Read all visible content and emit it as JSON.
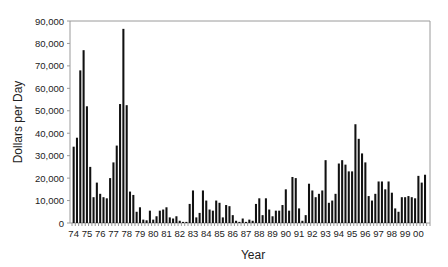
{
  "chart_data": {
    "type": "bar",
    "title": "",
    "xlabel": "Year",
    "ylabel": "Dollars per Day",
    "ylim": [
      0,
      90000
    ],
    "yticks": [
      "0",
      "10,000",
      "20,000",
      "30,000",
      "40,000",
      "50,000",
      "60,000",
      "70,000",
      "80,000",
      "90,000"
    ],
    "xtick_labels": [
      "74",
      "75",
      "76",
      "77",
      "78",
      "79",
      "80",
      "81",
      "82",
      "83",
      "84",
      "85",
      "86",
      "87",
      "88",
      "89",
      "90",
      "91",
      "92",
      "93",
      "94",
      "95",
      "96",
      "97",
      "98",
      "99",
      "00"
    ],
    "grid": false,
    "legend": null,
    "bar_color": "#111111",
    "frequency": "quarterly",
    "series": [
      {
        "name": "Dollars per Day",
        "values": [
          34000,
          38000,
          68000,
          77000,
          52000,
          25000,
          11500,
          18000,
          13000,
          11500,
          11000,
          20000,
          27000,
          34500,
          53000,
          86500,
          52500,
          14000,
          12500,
          5000,
          7000,
          1500,
          1200,
          5500,
          1500,
          3000,
          5500,
          6000,
          7000,
          2500,
          2000,
          3000,
          1000,
          500,
          500,
          8500,
          14500,
          2500,
          4500,
          14500,
          10000,
          6000,
          5500,
          10000,
          9000,
          2500,
          8000,
          7500,
          3500,
          1000,
          500,
          2000,
          500,
          1500,
          1000,
          8500,
          11000,
          3500,
          11000,
          6000,
          3000,
          5500,
          5500,
          8000,
          15000,
          5500,
          20500,
          20000,
          6500,
          1000,
          3500,
          17500,
          14500,
          11500,
          13000,
          14500,
          28000,
          9000,
          10000,
          13000,
          26500,
          28000,
          26000,
          23000,
          23000,
          44000,
          37500,
          31000,
          27000,
          12000,
          10000,
          13000,
          18500,
          18500,
          15000,
          18500,
          13500,
          6500,
          5000,
          11500,
          11500,
          12000,
          11500,
          11000,
          21000,
          18000,
          21500
        ]
      }
    ]
  }
}
